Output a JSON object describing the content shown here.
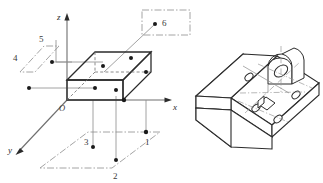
{
  "figure": {
    "title": "",
    "background_color": "#ffffff",
    "line_color": "#2b2b2b",
    "thin_line_color": "#8a8a8a",
    "dash_dot_color": "#9a9a9a"
  },
  "left_diagram": {
    "name": "isometric-box-with-axes",
    "axes": [
      {
        "id": "z",
        "label": "z",
        "direction": "up"
      },
      {
        "id": "x",
        "label": "x",
        "direction": "right"
      },
      {
        "id": "y",
        "label": "y",
        "direction": "down-left"
      }
    ],
    "origin": {
      "label": "O"
    },
    "point_labels": [
      {
        "id": "1",
        "label": "1",
        "plane": "xOy-bottom"
      },
      {
        "id": "2",
        "label": "2",
        "plane": "xOy-bottom"
      },
      {
        "id": "3",
        "label": "3",
        "plane": "xOy-bottom"
      },
      {
        "id": "4",
        "label": "4",
        "plane": "yOz-left"
      },
      {
        "id": "5",
        "label": "5",
        "plane": "yOz-left"
      },
      {
        "id": "6",
        "label": "6",
        "plane": "xOz-top-right"
      }
    ],
    "marked_points_count": 6,
    "box": {
      "type": "rectangular-prism",
      "marked_face_points": 6
    }
  },
  "right_diagram": {
    "name": "u-channel-bracket",
    "features": [
      {
        "id": "boss",
        "label": "",
        "type": "semicircular-boss-with-hole"
      },
      {
        "id": "hole-a",
        "label": "",
        "type": "circular-hole"
      },
      {
        "id": "hole-b",
        "label": "",
        "type": "circular-hole"
      },
      {
        "id": "hole-c",
        "label": "",
        "type": "circular-hole"
      },
      {
        "id": "hole-d",
        "label": "",
        "type": "circular-hole"
      },
      {
        "id": "slot",
        "label": "",
        "type": "rectangular-slot"
      }
    ]
  }
}
